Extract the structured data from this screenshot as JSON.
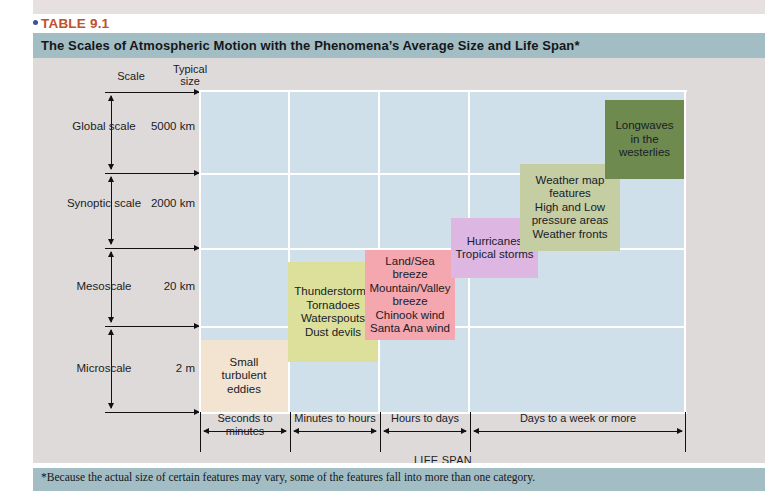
{
  "caption": {
    "bullet": "bullet-dot",
    "number": "TABLE 9.1",
    "title": "The Scales of Atmospheric Motion with the Phenomena’s Average Size and Life Span*"
  },
  "axis": {
    "scale_header": "Scale",
    "size_header_line1": "Typical",
    "size_header_line2": "size",
    "lifespan_title": "LIFE SPAN",
    "scales": [
      {
        "name_line1": "Global",
        "name_line2": "scale",
        "size": "5000 km"
      },
      {
        "name_line1": "Synoptic",
        "name_line2": "scale",
        "size": "2000 km"
      },
      {
        "name_line1": "Mesoscale",
        "name_line2": "",
        "size": "20 km"
      },
      {
        "name_line1": "Microscale",
        "name_line2": "",
        "size": "2 m"
      }
    ],
    "lifespans": [
      {
        "line1": "Seconds",
        "line2": "to",
        "line3": "minutes"
      },
      {
        "line1": "Minutes",
        "line2": "to",
        "line3": "hours"
      },
      {
        "line1": "Hours",
        "line2": "to",
        "line3": "days"
      },
      {
        "line1": "Days",
        "line2": "to",
        "line3": "a week or more"
      }
    ]
  },
  "boxes": [
    {
      "id": "small-turbulent-eddies",
      "lines": [
        "Small",
        "turbulent",
        "eddies"
      ],
      "color": "#f2e4d0"
    },
    {
      "id": "thunderstorms",
      "lines": [
        "Thunderstorms",
        "Tornadoes",
        "Waterspouts",
        "Dust devils"
      ],
      "color": "#dde09a"
    },
    {
      "id": "land-sea-breeze",
      "lines": [
        "Land/Sea",
        "breeze",
        "Mountain/Valley",
        "breeze",
        "Chinook wind",
        "Santa Ana wind"
      ],
      "color": "#f4a7ae"
    },
    {
      "id": "hurricanes",
      "lines": [
        "Hurricanes",
        "Tropical storms"
      ],
      "color": "#ddb6e2"
    },
    {
      "id": "weather-map-features",
      "lines": [
        "Weather map",
        "features",
        "High and Low",
        "pressure areas",
        "Weather fronts"
      ],
      "color": "#c5cda3"
    },
    {
      "id": "longwaves",
      "lines": [
        "Longwaves",
        "in the",
        "westerlies"
      ],
      "color": "#6f8a4e"
    }
  ],
  "colors": {
    "header_bar": "#a3bdc4",
    "plot_background": "#cfe0ea",
    "body_background": "#dedada",
    "table_number": "#c0512a",
    "bullet": "#3f4fa0"
  },
  "footnote": "*Because the actual size of certain features may vary, some of the features fall into more than one category."
}
